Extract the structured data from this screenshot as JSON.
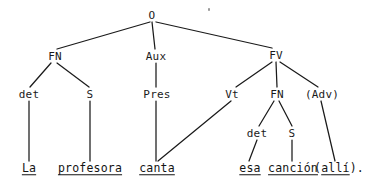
{
  "diagram": {
    "sentence": "La profesora canta esa canción (allí).",
    "ink_color": "#1a1a1a",
    "background_color": "#ffffff",
    "width": 388,
    "height": 186
  },
  "nodes": {
    "root": "O",
    "fn_subject": "FN",
    "aux": "Aux",
    "fv": "FV",
    "det1": "det",
    "s1": "S",
    "pres": "Pres",
    "vt": "Vt",
    "fn_object": "FN",
    "adv": "(Adv)",
    "det2": "det",
    "s2": "S"
  },
  "leaves": {
    "la": "La",
    "profesora": "profesora",
    "canta": "canta",
    "esa": "esa",
    "cancion": "canción",
    "alli_open": "(",
    "alli": "allí",
    "alli_close": ")."
  }
}
